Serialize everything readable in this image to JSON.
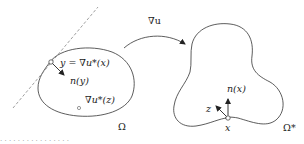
{
  "diagram": {
    "left_domain": {
      "label": "Ω",
      "boundary_point_label": "y = ∇u*(x)",
      "normal_label": "n(y)",
      "interior_point_label": "∇u*(z)",
      "tangent_line_style": "dashed"
    },
    "mapping": {
      "label": "∇u"
    },
    "right_domain": {
      "label": "Ω*",
      "boundary_point_label": "x",
      "normal_label": "n(x)",
      "direction_label": "z"
    },
    "caption_fragment": "· · · · · · · · · · · · · · · ·"
  },
  "colors": {
    "stroke": "#333333",
    "dashed": "#888888",
    "text": "#222222",
    "background": "#ffffff"
  }
}
